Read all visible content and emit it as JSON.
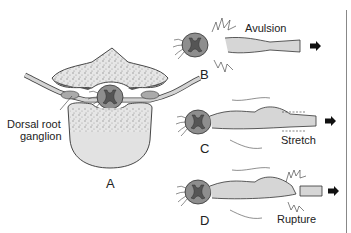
{
  "figure": {
    "panels": [
      {
        "id": "A",
        "label": "A",
        "description": "Cross-section of vertebra with spinal cord and nerve roots"
      },
      {
        "id": "B",
        "label": "B",
        "annotation": "Avulsion"
      },
      {
        "id": "C",
        "label": "C",
        "annotation": "Stretch"
      },
      {
        "id": "D",
        "label": "D",
        "annotation": "Rupture"
      }
    ],
    "callouts": {
      "dorsal_root_ganglion_line1": "Dorsal root",
      "dorsal_root_ganglion_line2": "ganglion"
    },
    "colors": {
      "bone_fill": "#e4e4e4",
      "bone_speckle": "#9a9a9a",
      "cord_fill": "#8c8c8c",
      "gray_matter": "#5a5a5a",
      "nerve_fill": "#d4d4d4",
      "outline": "#333333",
      "arrow": "#111111"
    }
  }
}
